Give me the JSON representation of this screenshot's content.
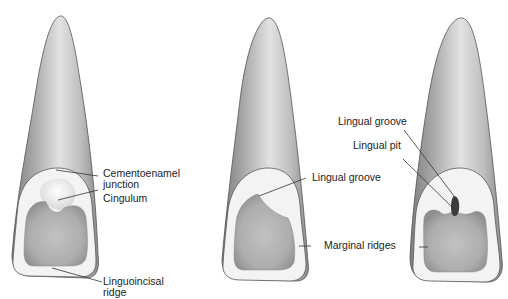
{
  "figure": {
    "colors": {
      "background": "#ffffff",
      "enamel_light": "#f4f4f4",
      "tooth_mid": "#c8c8c8",
      "tooth_dark": "#8a8a8a",
      "fossa": "#b9b9b9",
      "outline": "#555555",
      "leader": "#333333",
      "text": "#222222"
    },
    "teeth": [
      {
        "id": "tooth-1",
        "labels": [
          {
            "key": "cej",
            "line1": "Cementoenamel",
            "line2": "junction"
          },
          {
            "key": "cingulum",
            "line1": "Cingulum"
          },
          {
            "key": "linguoincisal",
            "line1": "Linguoincisal",
            "line2": "ridge"
          }
        ]
      },
      {
        "id": "tooth-2",
        "labels": [
          {
            "key": "lingual-groove",
            "line1": "Lingual groove"
          },
          {
            "key": "marginal-ridges",
            "line1": "Marginal ridges"
          }
        ]
      },
      {
        "id": "tooth-3",
        "labels": [
          {
            "key": "lingual-groove",
            "line1": "Lingual groove"
          },
          {
            "key": "lingual-pit",
            "line1": "Lingual pit"
          }
        ]
      }
    ]
  }
}
